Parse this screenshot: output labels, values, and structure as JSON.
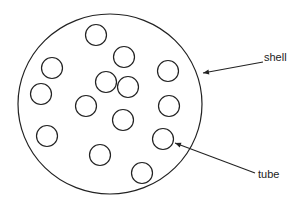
{
  "diagram": {
    "stroke_color": "#222222",
    "background": "#ffffff",
    "shell": {
      "label": "shell",
      "cx": 110,
      "cy": 104,
      "rx": 92,
      "ry": 90
    },
    "tube_radius": 10.5,
    "tubes": [
      {
        "cx": 96,
        "cy": 35
      },
      {
        "cx": 124,
        "cy": 57
      },
      {
        "cx": 52,
        "cy": 68
      },
      {
        "cx": 168,
        "cy": 71
      },
      {
        "cx": 106,
        "cy": 82
      },
      {
        "cx": 128,
        "cy": 87
      },
      {
        "cx": 41,
        "cy": 94
      },
      {
        "cx": 86,
        "cy": 106
      },
      {
        "cx": 169,
        "cy": 106
      },
      {
        "cx": 123,
        "cy": 120
      },
      {
        "cx": 47,
        "cy": 136
      },
      {
        "cx": 163,
        "cy": 139
      },
      {
        "cx": 100,
        "cy": 155
      },
      {
        "cx": 142,
        "cy": 173
      }
    ],
    "annotations": [
      {
        "id": "shell",
        "text": "shell",
        "text_x": 264,
        "text_y": 61,
        "from": [
          263,
          62
        ],
        "to": [
          203,
          73
        ]
      },
      {
        "id": "tube",
        "text": "tube",
        "text_x": 258,
        "text_y": 178,
        "from": [
          255,
          173
        ],
        "to": [
          175,
          143
        ]
      }
    ]
  }
}
